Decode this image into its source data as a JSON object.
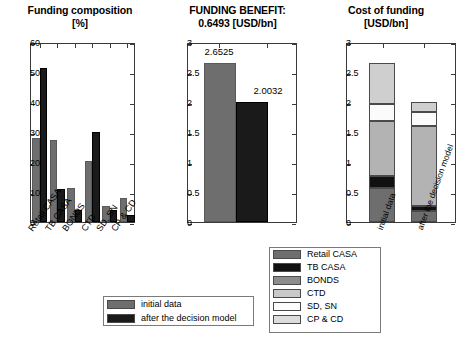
{
  "chart_data": [
    {
      "id": "funding-composition",
      "type": "bar",
      "title_line1": "Funding composition",
      "title_line2": "[%]",
      "xlabel": "",
      "ylabel": "",
      "ylim": [
        0,
        60
      ],
      "yticks": [
        0,
        10,
        20,
        30,
        40,
        50,
        60
      ],
      "ytick_labels": [
        "0",
        "10",
        "20",
        "30",
        "40",
        "50",
        "60"
      ],
      "grid": false,
      "categories": [
        "Retail CASA",
        "TB CASA",
        "BONDS",
        "CTD",
        "SD, SN",
        "CP & CD"
      ],
      "series": [
        {
          "name": "initial data",
          "color": "#6e6e6e",
          "values": [
            28.0,
            27.5,
            11.3,
            20.4,
            5.4,
            8.0
          ]
        },
        {
          "name": "after the decision model",
          "color": "#1a1a1a",
          "values": [
            51.5,
            11.0,
            4.0,
            30.1,
            4.1,
            2.5
          ]
        }
      ],
      "legend_position": "below-chart"
    },
    {
      "id": "funding-benefit",
      "type": "bar",
      "title_line1": "FUNDING BENEFIT:",
      "title_line2": "0.6493 [USD/bn]",
      "benefit_value": "0.6493",
      "benefit_units": "[USD/bn]",
      "xlabel": "",
      "ylabel": "",
      "ylim": [
        0,
        3
      ],
      "yticks": [
        0,
        0.5,
        1,
        1.5,
        2,
        2.5,
        3
      ],
      "ytick_labels": [
        "0",
        "0.5",
        "1",
        "1.5",
        "2",
        "2.5",
        "3"
      ],
      "grid": false,
      "categories": [
        "initial data",
        "after the decision model"
      ],
      "values": [
        2.6525,
        2.0032
      ],
      "data_labels": [
        "2.6525",
        "2.0032"
      ],
      "colors": [
        "#6e6e6e",
        "#1a1a1a"
      ]
    },
    {
      "id": "cost-of-funding",
      "type": "bar",
      "subtype": "stacked",
      "title_line1": "Cost of funding",
      "title_line2": "[USD/bn]",
      "xlabel": "",
      "ylabel": "",
      "ylim": [
        0,
        3
      ],
      "yticks": [
        0,
        0.5,
        1,
        1.5,
        2,
        2.5,
        3
      ],
      "ytick_labels": [
        "0",
        "0.5",
        "1",
        "1.5",
        "2",
        "2.5",
        "3"
      ],
      "grid": false,
      "categories": [
        "initial data",
        "after the decision model"
      ],
      "totals": [
        2.65,
        2.0
      ],
      "series": [
        {
          "name": "Retail CASA",
          "color": "#6e6e6e",
          "values": [
            0.57,
            0.18
          ]
        },
        {
          "name": "TB CASA",
          "color": "#111111",
          "values": [
            0.19,
            0.08
          ]
        },
        {
          "name": "BONDS",
          "color": "#b3b3b3",
          "values": [
            0.93,
            1.34
          ]
        },
        {
          "name": "CTD",
          "color": "#d6d6d6",
          "values": [
            0.0,
            0.0
          ]
        },
        {
          "name": "SD, SN",
          "color": "#fbfbfb",
          "values": [
            0.27,
            0.23
          ]
        },
        {
          "name": "CP & CD",
          "color": "#cfcfcf",
          "values": [
            0.69,
            0.17
          ]
        }
      ]
    }
  ],
  "legend_series": {
    "title": "",
    "items": [
      {
        "label": "Retail CASA",
        "color": "#6e6e6e"
      },
      {
        "label": "TB CASA",
        "color": "#111111"
      },
      {
        "label": "BONDS",
        "color": "#8c8c8c"
      },
      {
        "label": "CTD",
        "color": "#c9c9c9"
      },
      {
        "label": "SD, SN",
        "color": "#fdfdfd"
      },
      {
        "label": "CP & CD",
        "color": "#dcdcdc"
      }
    ]
  },
  "legend_compare": {
    "items": [
      {
        "label": "initial data",
        "color": "#6e6e6e"
      },
      {
        "label": "after the decision model",
        "color": "#1a1a1a"
      }
    ]
  }
}
